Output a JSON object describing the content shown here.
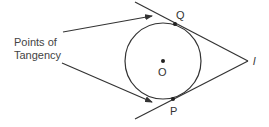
{
  "diagram": {
    "caption_lines": [
      "Points of",
      "Tangency"
    ],
    "labels": {
      "tangent_point_top": "Q",
      "tangent_point_bottom": "P",
      "center": "O",
      "external_point": "l"
    },
    "colors": {
      "stroke": "#333333",
      "text": "#444444",
      "background": "#ffffff"
    }
  }
}
